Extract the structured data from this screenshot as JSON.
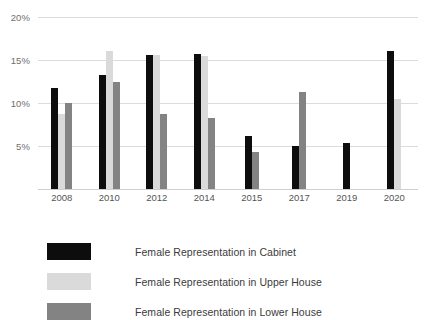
{
  "chart_data": {
    "type": "bar",
    "title": "",
    "subtitle": "",
    "xlabel": "",
    "ylabel": "",
    "categories": [
      "2008",
      "2010",
      "2012",
      "2014",
      "2015",
      "2017",
      "2019",
      "2020"
    ],
    "ylim": [
      0,
      20
    ],
    "y_ticks": [
      20,
      15,
      10,
      5
    ],
    "y_tick_labels": [
      "20%",
      "15%",
      "10%",
      "5%"
    ],
    "grid": true,
    "legend_position": "bottom-left",
    "series": [
      {
        "name": "Female Representation in Cabinet",
        "color": "#0d0d0d",
        "values": [
          11.8,
          13.3,
          15.6,
          15.7,
          6.2,
          5.0,
          5.4,
          16.0
        ]
      },
      {
        "name": "Female Representation in Upper House",
        "color": "#dadada",
        "values": [
          8.7,
          16.0,
          15.6,
          15.5,
          null,
          null,
          null,
          10.5
        ]
      },
      {
        "name": "Female Representation in Lower House",
        "color": "#838383",
        "values": [
          10.0,
          12.5,
          8.7,
          8.3,
          4.3,
          11.3,
          null,
          null
        ]
      }
    ]
  },
  "y_axis": {
    "ticks": [
      {
        "label": "20%",
        "value": 20
      },
      {
        "label": "15%",
        "value": 15
      },
      {
        "label": "10%",
        "value": 10
      },
      {
        "label": "5%",
        "value": 5
      }
    ]
  },
  "x_axis": {
    "ticks": [
      "2008",
      "2010",
      "2012",
      "2014",
      "2015",
      "2017",
      "2019",
      "2020"
    ]
  },
  "legend": {
    "items": [
      {
        "label": "Female Representation in Cabinet",
        "color": "#0d0d0d",
        "key": "cabinet"
      },
      {
        "label": "Female Representation in Upper House",
        "color": "#dadada",
        "key": "upper"
      },
      {
        "label": "Female Representation in Lower House",
        "color": "#838383",
        "key": "lower"
      }
    ]
  }
}
